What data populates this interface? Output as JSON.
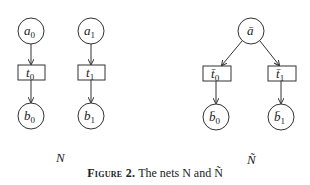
{
  "figure": {
    "caption_label": "Figure 2.",
    "caption_text": "The nets N and Ñ",
    "net_left_name": "N",
    "net_right_name": "Ñ"
  },
  "net_left": {
    "places": [
      {
        "id": "a0",
        "label": "a",
        "sub": "0"
      },
      {
        "id": "a1",
        "label": "a",
        "sub": "1"
      },
      {
        "id": "b0",
        "label": "b",
        "sub": "0"
      },
      {
        "id": "b1",
        "label": "b",
        "sub": "1"
      }
    ],
    "transitions": [
      {
        "id": "t0",
        "label": "t",
        "sub": "0"
      },
      {
        "id": "t1",
        "label": "t",
        "sub": "1"
      }
    ],
    "arcs": [
      [
        "a0",
        "t0"
      ],
      [
        "t0",
        "b0"
      ],
      [
        "a1",
        "t1"
      ],
      [
        "t1",
        "b1"
      ]
    ]
  },
  "net_right": {
    "places": [
      {
        "id": "abar",
        "label": "ā",
        "sub": ""
      },
      {
        "id": "b0bar",
        "label": "b̄",
        "sub": "0"
      },
      {
        "id": "b1bar",
        "label": "b̄",
        "sub": "1"
      }
    ],
    "transitions": [
      {
        "id": "t0bar",
        "label": "t̄",
        "sub": "0"
      },
      {
        "id": "t1bar",
        "label": "t̄",
        "sub": "1"
      }
    ],
    "arcs": [
      [
        "abar",
        "t0bar"
      ],
      [
        "abar",
        "t1bar"
      ],
      [
        "t0bar",
        "b0bar"
      ],
      [
        "t1bar",
        "b1bar"
      ]
    ]
  }
}
